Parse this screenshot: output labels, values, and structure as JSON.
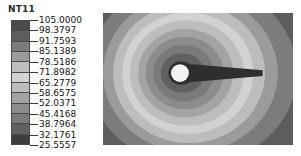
{
  "legend": {
    "title": "NT11",
    "labels": [
      "105.0000",
      "98.3797",
      "91.7593",
      "85.1389",
      "78.5186",
      "71.8982",
      "65.2779",
      "58.6575",
      "52.0371",
      "45.4168",
      "38.7964",
      "32.1761",
      "25.5557"
    ],
    "band_colors": [
      "#4b4b4b",
      "#5d5d5d",
      "#7c7c7c",
      "#9b9b9b",
      "#bdbdbd",
      "#d2d2d2",
      "#bdbdbd",
      "#a3a3a3",
      "#8c8c8c",
      "#7a7a7a",
      "#616161",
      "#3d3d3d"
    ],
    "swatch_border_color": "#4a4a4a",
    "tick_color": "#3a3a3a"
  },
  "chart_data": {
    "type": "heatmap",
    "title": "NT11",
    "xlabel": "",
    "ylabel": "",
    "field_name": "NT11",
    "contour_levels": [
      25.5557,
      32.1761,
      38.7964,
      45.4168,
      52.0371,
      58.6575,
      65.2779,
      71.8982,
      78.5186,
      85.1389,
      91.7593,
      98.3797,
      105.0
    ],
    "value_min": 25.5557,
    "value_max": 105.0,
    "level_step": 6.6204,
    "band_count": 12,
    "colormap": "grayscale",
    "legend_position": "left",
    "grid": false,
    "plot_background": "#6e6e6e",
    "features": {
      "hot_spot": {
        "name": "source-circle",
        "shape": "circle",
        "color": "#f2f2f2",
        "cx_frac": 0.405,
        "cy_frac": 0.455,
        "r_frac": 0.047
      },
      "wake": {
        "name": "tapering-wake-tail",
        "shape": "tapered-band",
        "color": "#2e2e2e",
        "direction": "right",
        "start_x_frac": 0.405,
        "end_x_frac": 0.84,
        "start_half_height_frac": 0.075,
        "end_half_height_frac": 0.022
      }
    },
    "contour_rings": [
      {
        "level": 105.0,
        "color": "#3d3d3d",
        "rx_frac": 0.07,
        "ry_frac": 0.09
      },
      {
        "level": 98.38,
        "color": "#616161",
        "rx_frac": 0.115,
        "ry_frac": 0.15
      },
      {
        "level": 91.76,
        "color": "#7a7a7a",
        "rx_frac": 0.16,
        "ry_frac": 0.215
      },
      {
        "level": 85.14,
        "color": "#8c8c8c",
        "rx_frac": 0.205,
        "ry_frac": 0.275
      },
      {
        "level": 78.52,
        "color": "#a3a3a3",
        "rx_frac": 0.25,
        "ry_frac": 0.335
      },
      {
        "level": 71.9,
        "color": "#bdbdbd",
        "rx_frac": 0.3,
        "ry_frac": 0.4
      },
      {
        "level": 65.28,
        "color": "#d2d2d2",
        "rx_frac": 0.345,
        "ry_frac": 0.46
      },
      {
        "level": 58.66,
        "color": "#bdbdbd",
        "rx_frac": 0.4,
        "ry_frac": 0.53
      },
      {
        "level": 52.04,
        "color": "#9b9b9b",
        "rx_frac": 0.46,
        "ry_frac": 0.6
      },
      {
        "level": 45.42,
        "color": "#7c7c7c",
        "rx_frac": 0.55,
        "ry_frac": 0.7
      },
      {
        "level": 38.8,
        "color": "#5d5d5d",
        "rx_frac": 0.68,
        "ry_frac": 0.85
      },
      {
        "level": 32.18,
        "color": "#4b4b4b",
        "rx_frac": 0.9,
        "ry_frac": 1.05
      }
    ]
  }
}
